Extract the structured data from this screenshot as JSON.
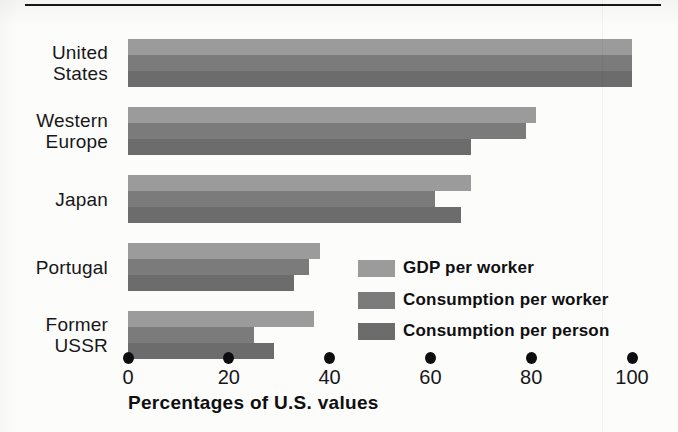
{
  "figure": {
    "has_top_rule": true,
    "background_color": "#fcfcfa"
  },
  "chart_data": {
    "type": "bar",
    "orientation": "horizontal",
    "title": "",
    "subtitle": "",
    "xlabel": "Percentages of U.S. values",
    "ylabel": "",
    "xlim": [
      0,
      100
    ],
    "xticks": [
      0,
      20,
      40,
      60,
      80,
      100
    ],
    "xtick_labels": [
      "0",
      "20",
      "40",
      "60",
      "80",
      "100"
    ],
    "grid": false,
    "legend_position": "inside-lower-right",
    "categories": [
      "United States",
      "Western Europe",
      "Japan",
      "Portugal",
      "Former USSR"
    ],
    "category_lines": [
      [
        "United",
        "States"
      ],
      [
        "Western",
        "Europe"
      ],
      [
        "Japan"
      ],
      [
        "Portugal"
      ],
      [
        "Former",
        "USSR"
      ]
    ],
    "series": [
      {
        "name": "GDP per worker",
        "color": "#9b9b9b",
        "values": [
          100,
          81,
          68,
          38,
          37
        ]
      },
      {
        "name": "Consumption per worker",
        "color": "#7b7b7b",
        "values": [
          100,
          79,
          61,
          36,
          25
        ]
      },
      {
        "name": "Consumption per person",
        "color": "#6c6c6c",
        "values": [
          100,
          68,
          66,
          33,
          29
        ]
      }
    ]
  }
}
